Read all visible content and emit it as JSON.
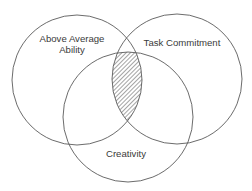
{
  "diagram": {
    "type": "venn",
    "sets": [
      {
        "id": "ability",
        "label_lines": [
          "Above Average",
          "Ability"
        ]
      },
      {
        "id": "task",
        "label_lines": [
          "Task Commitment"
        ]
      },
      {
        "id": "creativity",
        "label_lines": [
          "Creativity"
        ]
      }
    ],
    "highlighted_region": {
      "description": "Intersection of all three circles",
      "fill": "diagonal-hatch"
    }
  },
  "labels": {
    "ability_line1": "Above Average",
    "ability_line2": "Ability",
    "task": "Task Commitment",
    "creativity": "Creativity"
  },
  "colors": {
    "stroke": "#5a5a5a",
    "text": "#3a3a3a",
    "hatch": "#4a4a4a",
    "background": "#ffffff"
  }
}
